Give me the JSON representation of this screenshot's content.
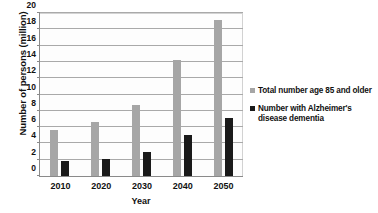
{
  "chart_data": {
    "type": "bar",
    "title": "",
    "xlabel": "Year",
    "ylabel": "Number of persons (million)",
    "categories": [
      "2010",
      "2020",
      "2030",
      "2040",
      "2050"
    ],
    "series": [
      {
        "name": "Total number age 85 and older",
        "color": "#a6a6a6",
        "values": [
          5.7,
          6.6,
          8.7,
          14.2,
          19.2
        ]
      },
      {
        "name": "Number with Alzheimer's disease dementia",
        "color": "#1a1a1a",
        "values": [
          1.9,
          2.1,
          2.9,
          5.0,
          7.1
        ]
      }
    ],
    "ylim": [
      0,
      20
    ],
    "yticks": [
      0,
      2,
      4,
      6,
      8,
      10,
      12,
      14,
      16,
      18,
      20
    ],
    "ytick_labels": [
      "0",
      "2",
      "4",
      "6",
      "8",
      "10",
      "12",
      "14",
      "16",
      "18",
      "20"
    ],
    "grid": true,
    "legend_position": "right"
  },
  "legend": {
    "items": [
      {
        "label": "Total number age 85 and older",
        "color": "#a6a6a6"
      },
      {
        "label": "Number with Alzheimer's disease dementia",
        "color": "#1a1a1a"
      }
    ]
  }
}
